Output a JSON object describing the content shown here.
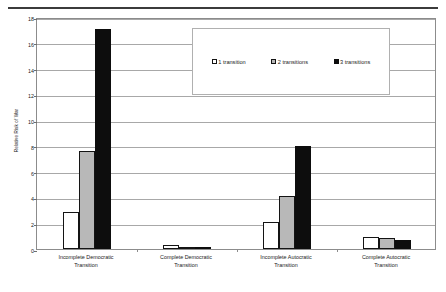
{
  "figure": {
    "y_axis_title": "Relative Risk of War"
  },
  "chart_data": {
    "type": "bar",
    "title": "",
    "xlabel": "",
    "ylabel": "Relative Risk of War",
    "ylim": [
      0,
      18
    ],
    "yticks": [
      0,
      2,
      4,
      6,
      8,
      10,
      12,
      14,
      16,
      18
    ],
    "grid": true,
    "legend_position": "upper-right-inside",
    "categories": [
      "Incomplete Democratic Transition",
      "Complete Democratic Transition",
      "Incomplete Autocratic Transition",
      "Complete Autocratic Transition"
    ],
    "category_lines": [
      [
        "Incomplete Democratic",
        "Transition"
      ],
      [
        "Complete Democratic",
        "Transition"
      ],
      [
        "Incomplete Autocratic",
        "Transition"
      ],
      [
        "Complete Autocratic",
        "Transition"
      ]
    ],
    "series": [
      {
        "name": "1 transition",
        "color": "#ffffff",
        "values": [
          2.85,
          0.3,
          2.1,
          0.9
        ]
      },
      {
        "name": "2 transitions",
        "color": "#b8b8b8",
        "values": [
          7.6,
          0.12,
          4.15,
          0.85
        ]
      },
      {
        "name": "3 transitions",
        "color": "#0d0d0d",
        "values": [
          17.05,
          0.05,
          8.0,
          0.7
        ]
      }
    ]
  }
}
